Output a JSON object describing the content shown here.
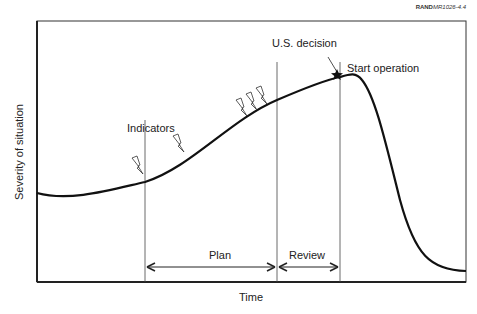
{
  "figure_ref": {
    "prefix": "RAND",
    "id": "MR1026-4.4"
  },
  "axes": {
    "xlabel": "Time",
    "ylabel": "Severity of situation"
  },
  "annotations": {
    "indicators": "Indicators",
    "us_decision": "U.S. decision",
    "start_operation": "Start operation",
    "plan": "Plan",
    "review": "Review"
  },
  "markers": {
    "vertical_lines_x": [
      145,
      277,
      340
    ],
    "indicator_icon": "lightning-bolt-icon",
    "decision_icon": "star-icon"
  },
  "colors": {
    "line": "#111111",
    "frame": "#222222",
    "text": "#222222"
  }
}
